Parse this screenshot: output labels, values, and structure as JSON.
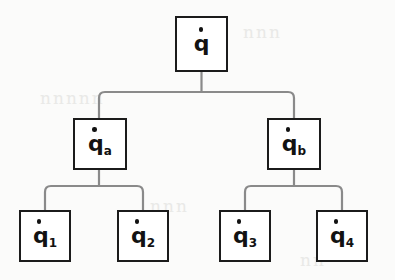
{
  "diagram": {
    "type": "tree",
    "orientation": "top-down",
    "levels": 3,
    "canvas": {
      "width": 395,
      "height": 280
    },
    "colors": {
      "background": "#fbfbfa",
      "node_fill": "#ffffff",
      "node_border": "#1b1b1b",
      "edge": "#8a8a8a",
      "text": "#121212",
      "ghost": "#e9e9e7"
    }
  },
  "nodes": {
    "root": {
      "id": "q",
      "base": "q",
      "subscript": "",
      "accent": "dot",
      "reading": "q-dot",
      "x": 175,
      "y": 16,
      "w": 53,
      "h": 56
    },
    "mid": [
      {
        "id": "qa",
        "base": "q",
        "subscript": "a",
        "accent": "dot",
        "reading": "q-dot-a",
        "x": 73,
        "y": 118,
        "w": 54,
        "h": 52
      },
      {
        "id": "qb",
        "base": "q",
        "subscript": "b",
        "accent": "dot",
        "reading": "q-dot-b",
        "x": 267,
        "y": 118,
        "w": 54,
        "h": 52
      }
    ],
    "leaves": [
      {
        "id": "q1",
        "base": "q",
        "subscript": "1",
        "accent": "dot",
        "reading": "q-dot-1",
        "x": 19,
        "y": 210,
        "w": 52,
        "h": 52
      },
      {
        "id": "q2",
        "base": "q",
        "subscript": "2",
        "accent": "dot",
        "reading": "q-dot-2",
        "x": 117,
        "y": 210,
        "w": 52,
        "h": 52
      },
      {
        "id": "q3",
        "base": "q",
        "subscript": "3",
        "accent": "dot",
        "reading": "q-dot-3",
        "x": 219,
        "y": 210,
        "w": 52,
        "h": 52
      },
      {
        "id": "q4",
        "base": "q",
        "subscript": "4",
        "accent": "dot",
        "reading": "q-dot-4",
        "x": 316,
        "y": 210,
        "w": 52,
        "h": 52
      }
    ]
  },
  "edges": [
    {
      "from": "q",
      "to": "qa"
    },
    {
      "from": "q",
      "to": "qb"
    },
    {
      "from": "qa",
      "to": "q1"
    },
    {
      "from": "qa",
      "to": "q2"
    },
    {
      "from": "qb",
      "to": "q3"
    },
    {
      "from": "qb",
      "to": "q4"
    }
  ],
  "ghost_text": [
    {
      "text": "nnn",
      "x": 243,
      "y": 22
    },
    {
      "text": "nnnnn",
      "x": 40,
      "y": 88
    },
    {
      "text": "nnn",
      "x": 150,
      "y": 196
    },
    {
      "text": "nn",
      "x": 300,
      "y": 250
    }
  ]
}
